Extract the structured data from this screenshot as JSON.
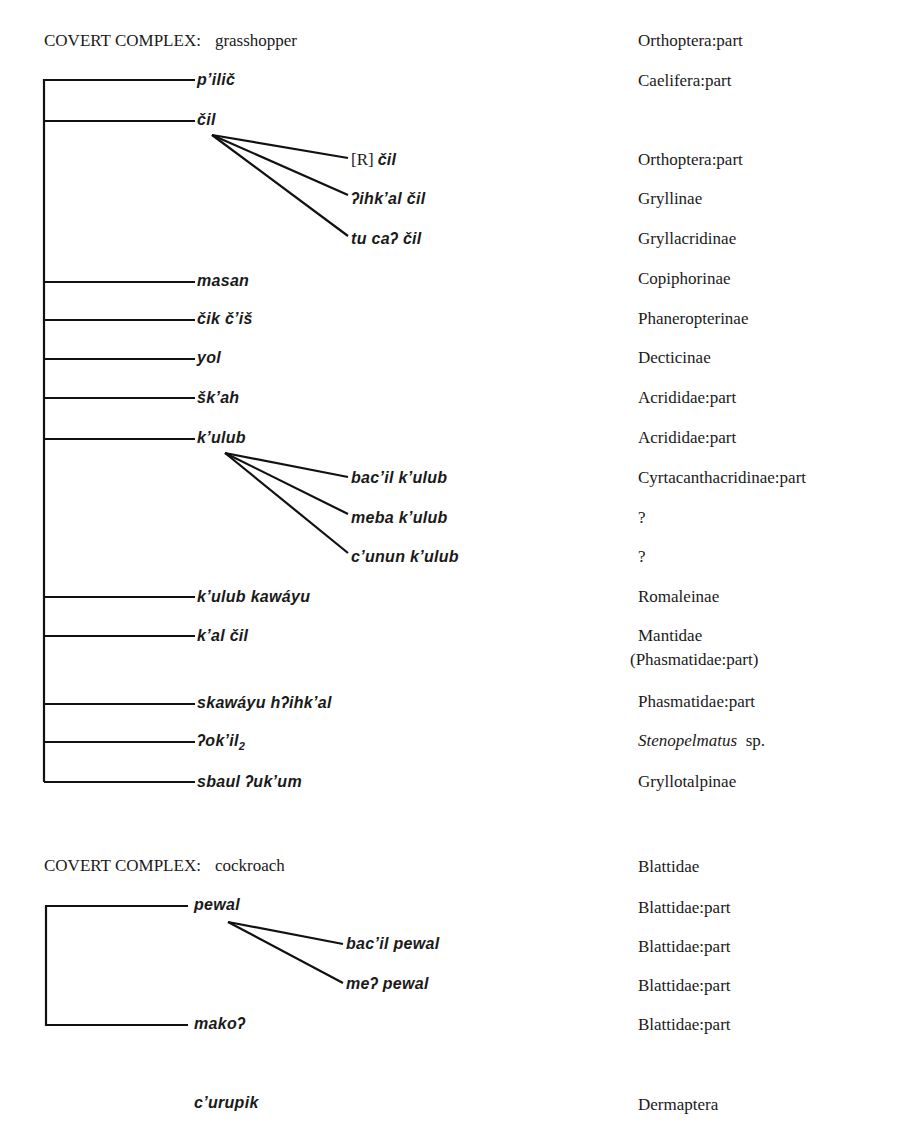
{
  "sections": [
    {
      "header": {
        "label": "COVERT COMPLEX:",
        "name": "grasshopper",
        "gloss": "Orthoptera:part"
      },
      "items": [
        {
          "term": "p’ilič",
          "gloss": "Caelifera:part"
        },
        {
          "term": "čil",
          "gloss": ""
        },
        {
          "term": "čil",
          "prefix": "[R]",
          "gloss": "Orthoptera:part",
          "parent": "čil"
        },
        {
          "term": "ʔihk’al čil",
          "gloss": "Gryllinae",
          "parent": "čil"
        },
        {
          "term": "tu caʔ čil",
          "gloss": "Gryllacridinae",
          "parent": "čil"
        },
        {
          "term": "masan",
          "gloss": "Copiphorinae"
        },
        {
          "term": "čik č’iš",
          "gloss": "Phaneropterinae"
        },
        {
          "term": "yol",
          "gloss": "Decticinae"
        },
        {
          "term": "šk’ah",
          "gloss": "Acrididae:part"
        },
        {
          "term": "k’ulub",
          "gloss": "Acrididae:part"
        },
        {
          "term": "bac’il k’ulub",
          "gloss": "Cyrtacanthacridinae:part",
          "parent": "k’ulub"
        },
        {
          "term": "meba k’ulub",
          "gloss": "?",
          "parent": "k’ulub"
        },
        {
          "term": "c’unun k’ulub",
          "gloss": "?",
          "parent": "k’ulub"
        },
        {
          "term": "k’ulub kawáyu",
          "gloss": "Romaleinae"
        },
        {
          "term": "k’al čil",
          "gloss": "Mantidae",
          "gloss2": "(Phasmatidae:part)"
        },
        {
          "term": "skawáyu hʔihk’al",
          "gloss": "Phasmatidae:part"
        },
        {
          "term": "ʔok’il",
          "subscript": "2",
          "gloss_italic": "Stenopelmatus",
          "gloss": "sp."
        },
        {
          "term": "sbaul ʔuk’um",
          "gloss": "Gryllotalpinae"
        }
      ]
    },
    {
      "header": {
        "label": "COVERT COMPLEX:",
        "name": "cockroach",
        "gloss": "Blattidae"
      },
      "items": [
        {
          "term": "pewal",
          "gloss": "Blattidae:part"
        },
        {
          "term": "bac’il pewal",
          "gloss": "Blattidae:part",
          "parent": "pewal"
        },
        {
          "term": "meʔ pewal",
          "gloss": "Blattidae:part",
          "parent": "pewal"
        },
        {
          "term": "makoʔ",
          "gloss": "Blattidae:part"
        }
      ]
    },
    {
      "standalone": {
        "term": "c’urupik",
        "gloss": "Dermaptera"
      }
    }
  ]
}
